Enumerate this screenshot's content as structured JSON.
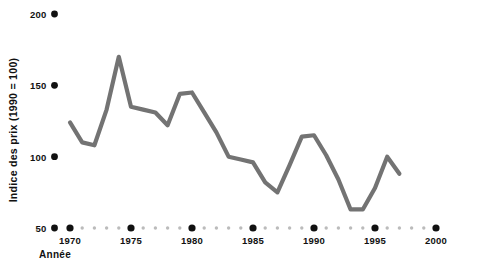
{
  "chart_data": {
    "type": "line",
    "title": "",
    "xlabel": "Année",
    "ylabel": "Indice des prix (1990 = 100)",
    "xlim": [
      1969,
      2001
    ],
    "ylim": [
      50,
      205
    ],
    "grid": false,
    "legend": "none",
    "series_color": "#737373",
    "axis_dot_color": "#111111",
    "minor_dot_color": "#bbbbbb",
    "y_ticks": [
      50,
      100,
      150,
      200
    ],
    "y_tick_labels": [
      "50",
      "100",
      "150",
      "200"
    ],
    "x_ticks": [
      1970,
      1975,
      1980,
      1985,
      1990,
      1995,
      2000
    ],
    "x_tick_labels": [
      "1970",
      "1975",
      "1980",
      "1985",
      "1990",
      "1995",
      "2000"
    ],
    "x_minor_ticks": [
      1971,
      1972,
      1973,
      1974,
      1976,
      1977,
      1978,
      1979,
      1981,
      1982,
      1983,
      1984,
      1986,
      1987,
      1988,
      1989,
      1991,
      1992,
      1993,
      1994,
      1996,
      1997,
      1998,
      1999
    ],
    "x": [
      1970,
      1971,
      1972,
      1973,
      1974,
      1975,
      1976,
      1977,
      1978,
      1979,
      1980,
      1981,
      1982,
      1983,
      1984,
      1985,
      1986,
      1987,
      1988,
      1989,
      1990,
      1991,
      1992,
      1993,
      1994,
      1995,
      1996,
      1997
    ],
    "values": [
      124,
      110,
      108,
      133,
      170,
      135,
      133,
      131,
      122,
      144,
      145,
      131,
      117,
      100,
      98,
      96,
      82,
      75,
      94,
      114,
      115,
      101,
      84,
      63,
      63,
      78,
      100,
      88
    ]
  },
  "series_name": "Indice des prix"
}
